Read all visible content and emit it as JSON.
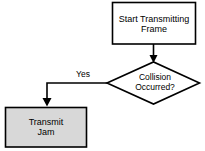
{
  "diagram": {
    "type": "flowchart",
    "background_color": "#ffffff",
    "stroke_color": "#000000",
    "text_color": "#000000",
    "nodes": [
      {
        "id": "start",
        "shape": "rectangle",
        "label": "Start Transmitting\nFrame",
        "line1": "Start Transmitting",
        "line2": "Frame",
        "fill": "#ffffff",
        "stroke": "#000000"
      },
      {
        "id": "decision",
        "shape": "diamond",
        "label": "Collision\nOccurred?",
        "line1": "Collision",
        "line2": "Occurred?",
        "fill": "#ffffff",
        "stroke": "#000000"
      },
      {
        "id": "jam",
        "shape": "rectangle",
        "label": "Transmit\nJam",
        "line1": "Transmit",
        "line2": "Jam",
        "fill": "#d8d8d8",
        "stroke": "#000000"
      }
    ],
    "edges": [
      {
        "id": "start-to-decision",
        "from": "start",
        "to": "decision",
        "label": "",
        "arrow": true
      },
      {
        "id": "decision-to-jam",
        "from": "decision",
        "to": "jam",
        "label": "Yes",
        "arrow": true
      }
    ]
  }
}
